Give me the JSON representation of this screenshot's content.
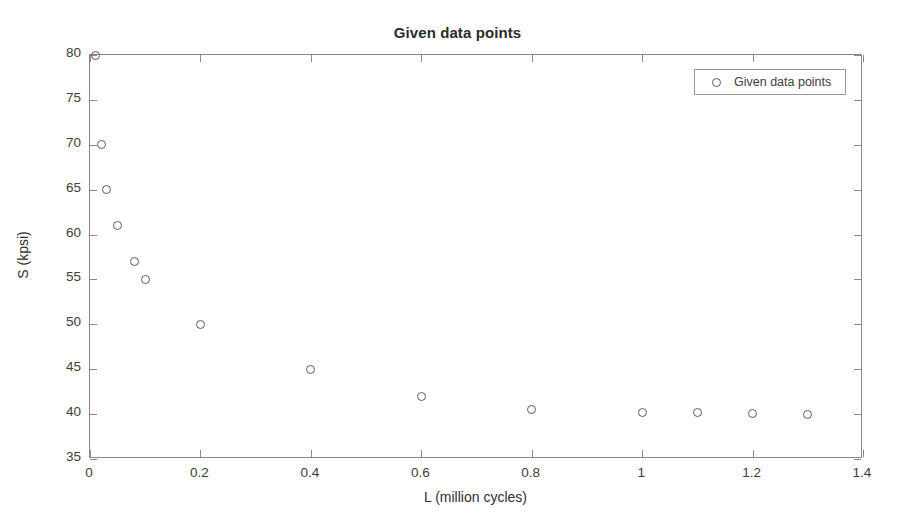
{
  "figure": {
    "title": "Given data points",
    "background": "#ffffff",
    "axis_color": "#8a8a8a",
    "marker_color": "#5a5a5a"
  },
  "legend": {
    "position": "northeast",
    "entries": [
      {
        "label": "Given data points",
        "marker": "circle-marker"
      }
    ]
  },
  "chart_data": {
    "type": "scatter",
    "title": "Given data points",
    "xlabel": "L (million cycles)",
    "ylabel": "S (kpsi)",
    "xlim": [
      0,
      1.4
    ],
    "ylim": [
      35,
      80
    ],
    "xticks": [
      0,
      0.2,
      0.4,
      0.6,
      0.8,
      1,
      1.2,
      1.4
    ],
    "xticklabels": [
      "0",
      "0.2",
      "0.4",
      "0.6",
      "0.8",
      "1",
      "1.2",
      "1.4"
    ],
    "yticks": [
      35,
      40,
      45,
      50,
      55,
      60,
      65,
      70,
      75,
      80
    ],
    "yticklabels": [
      "35",
      "40",
      "45",
      "50",
      "55",
      "60",
      "65",
      "70",
      "75",
      "80"
    ],
    "grid": false,
    "legend": "Given data points",
    "series": [
      {
        "name": "Given data points",
        "marker": "o",
        "color": "#5a5a5a",
        "x": [
          0.01,
          0.02,
          0.03,
          0.05,
          0.08,
          0.1,
          0.2,
          0.4,
          0.6,
          0.8,
          1.0,
          1.1,
          1.2,
          1.3
        ],
        "y": [
          80,
          70,
          65,
          61,
          57,
          55,
          50,
          45,
          42,
          40.5,
          40.2,
          40.2,
          40.1,
          40.0
        ]
      }
    ]
  }
}
